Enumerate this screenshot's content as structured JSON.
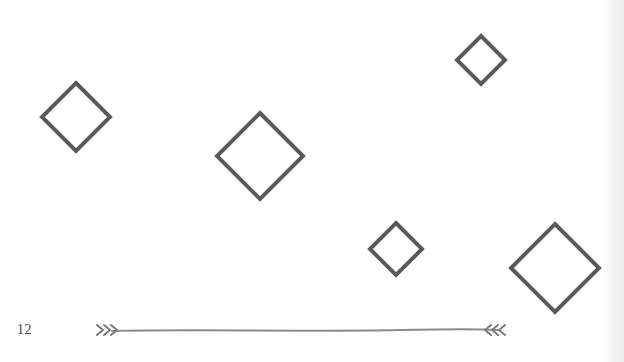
{
  "page": {
    "number": "12",
    "colors": {
      "background": "#ffffff",
      "stroke": "#5a5a5a",
      "divider": "#8a8a8a",
      "text": "#444444"
    }
  },
  "diamonds": [
    {
      "cx": 76,
      "cy": 117,
      "half": 34
    },
    {
      "cx": 260,
      "cy": 156,
      "half": 43
    },
    {
      "cx": 481,
      "cy": 60,
      "half": 24
    },
    {
      "cx": 396,
      "cy": 249,
      "half": 26
    },
    {
      "cx": 555,
      "cy": 268,
      "half": 44
    }
  ],
  "divider": {
    "y": 330,
    "x_start": 96,
    "x_end": 507,
    "icon_left": "arrow-fletching-right",
    "icon_right": "arrow-fletching-left"
  }
}
